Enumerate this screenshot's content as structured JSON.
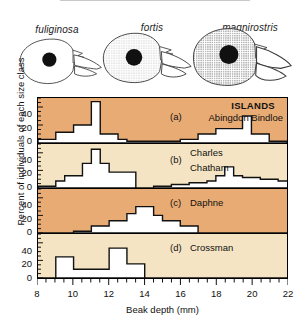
{
  "figure": {
    "species_panel": {
      "species": [
        {
          "name": "fuliginosa",
          "shading": "none",
          "label_x": 57,
          "label_y": 24,
          "head_x": 14,
          "head_y": 34,
          "scale": 0.8
        },
        {
          "name": "fortis",
          "shading": "light",
          "label_x": 152,
          "label_y": 22,
          "head_x": 97,
          "head_y": 28,
          "scale": 1.0
        },
        {
          "name": "magnirostris",
          "shading": "heavy",
          "label_x": 248,
          "label_y": 22,
          "head_x": 186,
          "head_y": 22,
          "scale": 1.18
        }
      ]
    },
    "chart_data": {
      "type": "bar",
      "title": "Beak depth distributions of Galapagos ground finches",
      "xlabel": "Beak depth (mm)",
      "ylabel": "Percent of individuals of each size class",
      "xlim": [
        8,
        22
      ],
      "ylim": [
        0,
        50
      ],
      "xticks": [
        8,
        10,
        12,
        14,
        16,
        18,
        20,
        22
      ],
      "xtick_labels": [
        "8",
        "10",
        "12",
        "14",
        "16",
        "18",
        "20",
        "22"
      ],
      "minor_tick_step": 0.5,
      "yticks": [
        0,
        20,
        40
      ],
      "ytick_labels": [
        "0",
        "20",
        "40"
      ],
      "grid": false,
      "legend_title": "ISLANDS",
      "bin_width": 0.5,
      "panels": [
        {
          "code": "(a)",
          "islands": "Abingdon  Bindloe",
          "background": "#e8ab74",
          "bin_start": 8.0,
          "values": [
            4,
            4,
            12,
            12,
            20,
            20,
            46,
            10,
            10,
            4,
            2,
            2,
            2,
            2,
            2,
            2,
            4,
            4,
            10,
            10,
            16,
            16,
            16,
            30,
            10,
            10,
            2,
            2,
            0,
            0,
            0,
            0,
            2,
            2,
            2,
            2,
            4,
            4,
            2,
            6,
            6,
            12,
            12,
            6,
            10,
            14,
            10,
            14,
            6,
            6,
            2,
            2,
            0,
            0,
            0,
            0
          ]
        },
        {
          "code": "(b)",
          "islands_line1": "Charles",
          "islands_line2": "Chatham",
          "background": "#f5e4c3",
          "bin_start": 8.0,
          "values": [
            2,
            2,
            8,
            14,
            14,
            28,
            44,
            28,
            18,
            18,
            18,
            0,
            0,
            2,
            2,
            4,
            4,
            6,
            6,
            8,
            14,
            24,
            14,
            12,
            12,
            10,
            10,
            8,
            8,
            6,
            6,
            4,
            4,
            2,
            2,
            1,
            1,
            0,
            0,
            0,
            0,
            0,
            0,
            0,
            0,
            0,
            0,
            0,
            0,
            0,
            0,
            0,
            0,
            0,
            0,
            0
          ]
        },
        {
          "code": "(c)",
          "islands": "Daphne",
          "background": "#e8ab74",
          "bin_start": 8.0,
          "values": [
            0,
            0,
            0,
            0,
            2,
            2,
            8,
            8,
            14,
            14,
            22,
            30,
            30,
            20,
            14,
            14,
            8,
            8,
            0,
            0,
            0,
            0,
            0,
            0,
            0,
            0,
            0,
            0,
            0,
            0,
            0,
            0,
            0,
            0,
            0,
            0,
            0,
            0,
            0,
            0,
            0,
            0,
            0,
            0,
            0,
            0,
            0,
            0,
            0,
            0,
            0,
            0,
            0,
            0,
            0,
            0
          ]
        },
        {
          "code": "(d)",
          "islands": "Crossman",
          "background": "#f5e4c3",
          "bin_start": 8.0,
          "values": [
            0,
            0,
            24,
            24,
            10,
            10,
            10,
            10,
            34,
            34,
            16,
            16,
            0,
            0,
            0,
            0,
            0,
            0,
            0,
            0,
            0,
            0,
            0,
            0,
            0,
            0,
            0,
            0,
            0,
            0,
            0,
            0,
            0,
            0,
            0,
            0,
            0,
            0,
            0,
            0,
            0,
            0,
            0,
            0,
            0,
            0,
            0,
            0,
            0,
            0,
            0,
            0,
            0,
            0,
            0,
            0
          ]
        }
      ]
    }
  }
}
